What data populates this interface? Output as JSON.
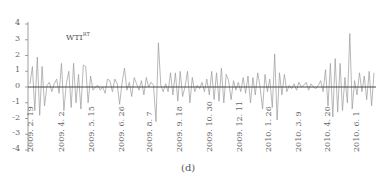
{
  "chart_data": {
    "type": "line",
    "title": "",
    "panel_caption": "(d)",
    "series_label": "WTI",
    "series_label_sup": "RT",
    "xlabel": "",
    "ylabel": "",
    "ylim": [
      -4,
      4
    ],
    "yticks": [
      4,
      3,
      2,
      1,
      0,
      -1,
      -2,
      -3,
      -4
    ],
    "xtick_labels": [
      "2009.2.19",
      "2009.4.2",
      "2009.5.15",
      "2009.6.26",
      "2009.8.7",
      "2009.9.18",
      "2009.10.30",
      "2009.12.11",
      "2010.1.26",
      "2010.3.9",
      "2010.4.20",
      "2010.6.1"
    ],
    "grid": false,
    "legend": "none",
    "zero_line": true,
    "series": [
      {
        "name": "WTI RT",
        "values": [
          0.2,
          1.3,
          -1.5,
          1.9,
          -1.8,
          1.3,
          -1.2,
          0.1,
          0.3,
          -0.3,
          0.2,
          0.5,
          -0.4,
          1.5,
          -1.5,
          0.2,
          1.0,
          -1.3,
          1.5,
          -1.0,
          0.8,
          -1.4,
          1.4,
          1.3,
          -1.0,
          0.7,
          -0.2,
          0.0,
          0.1,
          -0.2,
          0.0,
          -0.4,
          0.5,
          0.4,
          -0.3,
          0.5,
          0.2,
          -1.1,
          0.3,
          1.2,
          -0.2,
          0.3,
          -0.6,
          0.6,
          0.2,
          -0.2,
          0.4,
          -0.5,
          0.6,
          0.0,
          0.3,
          0.1,
          -2.2,
          2.8,
          0.1,
          -0.3,
          0.2,
          -0.3,
          0.9,
          -0.5,
          0.9,
          -0.9,
          1.0,
          -0.6,
          0.0,
          1.0,
          -1.0,
          0.6,
          -0.3,
          0.1,
          -0.1,
          0.3,
          -0.3,
          0.5,
          -0.5,
          1.0,
          -0.8,
          0.9,
          -0.9,
          1.2,
          -1.0,
          0.8,
          0.4,
          -0.8,
          0.4,
          -0.2,
          0.3,
          -0.3,
          0.6,
          -0.4,
          0.7,
          -1.0,
          0.6,
          -0.5,
          0.9,
          0.0,
          -1.4,
          0.8,
          -0.3,
          0.5,
          -1.3,
          2.1,
          -2.1,
          0.9,
          -0.5,
          0.8,
          -0.3,
          0.1,
          -0.1,
          0.2,
          -0.2,
          0.3,
          0.0,
          0.1,
          0.3,
          -0.2,
          0.2,
          0.0,
          -0.1,
          0.1,
          0.4,
          -0.3,
          1.1,
          -1.2,
          1.5,
          -1.9,
          1.8,
          -1.6,
          1.5,
          -1.5,
          0.6,
          -1.0,
          3.4,
          -1.4,
          0.4,
          -0.5,
          0.9,
          -0.3,
          0.7,
          -0.8,
          1.0,
          -1.2,
          0.9
        ]
      }
    ]
  }
}
